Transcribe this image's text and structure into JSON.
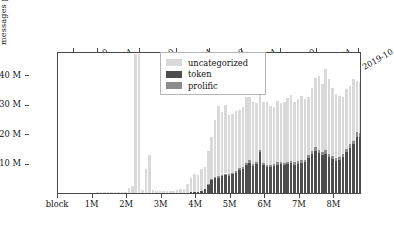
{
  "chart_data": {
    "type": "bar",
    "subtype": "stacked-bar",
    "title": "",
    "subtitle": "",
    "xlabel": "block",
    "ylabel": "messages per 100 k blocks",
    "xlim": [
      0,
      8800000
    ],
    "ylim": [
      0,
      48000000
    ],
    "grid": false,
    "legend_position": "top-center-inside",
    "bin_width_blocks": 100000,
    "y_tick_labels": [
      "10 M",
      "20 M",
      "30 M",
      "40 M"
    ],
    "y_tick_values": [
      10000000,
      20000000,
      30000000,
      40000000
    ],
    "x_bottom_tick_labels": [
      "block",
      "1M",
      "2M",
      "3M",
      "4M",
      "5M",
      "6M",
      "7M",
      "8M"
    ],
    "x_bottom_tick_values": [
      0,
      1000000,
      2000000,
      3000000,
      4000000,
      5000000,
      6000000,
      7000000,
      8000000
    ],
    "x_top_tick_labels": [
      "2015-10",
      "2016-04",
      "2016-10",
      "2017-04",
      "2017-10",
      "2018-04",
      "2018-10",
      "2019-04",
      "2019-10"
    ],
    "x_top_tick_values": [
      450000,
      1150000,
      2380000,
      3450000,
      4400000,
      5320000,
      6450000,
      7500000,
      8700000
    ],
    "series": [
      {
        "name": "uncategorized",
        "color": "#d9d9d9",
        "stack_order": 3
      },
      {
        "name": "token",
        "color": "#4d4d4d",
        "stack_order": 1
      },
      {
        "name": "prolific",
        "color": "#8c8c8c",
        "stack_order": 2
      }
    ],
    "x": [
      50000,
      150000,
      250000,
      350000,
      450000,
      550000,
      650000,
      750000,
      850000,
      950000,
      1050000,
      1150000,
      1250000,
      1350000,
      1450000,
      1550000,
      1650000,
      1750000,
      1850000,
      1950000,
      2050000,
      2150000,
      2250000,
      2350000,
      2450000,
      2550000,
      2650000,
      2750000,
      2850000,
      2950000,
      3050000,
      3150000,
      3250000,
      3350000,
      3450000,
      3550000,
      3650000,
      3750000,
      3850000,
      3950000,
      4050000,
      4150000,
      4250000,
      4350000,
      4450000,
      4550000,
      4650000,
      4750000,
      4850000,
      4950000,
      5050000,
      5150000,
      5250000,
      5350000,
      5450000,
      5550000,
      5650000,
      5750000,
      5850000,
      5950000,
      6050000,
      6150000,
      6250000,
      6350000,
      6450000,
      6550000,
      6650000,
      6750000,
      6850000,
      6950000,
      7050000,
      7150000,
      7250000,
      7350000,
      7450000,
      7550000,
      7650000,
      7750000,
      7850000,
      7950000,
      8050000,
      8150000,
      8250000,
      8350000,
      8450000,
      8550000,
      8650000,
      8750000
    ],
    "values_uncategorized": [
      30000,
      40000,
      50000,
      60000,
      70000,
      80000,
      90000,
      100000,
      110000,
      120000,
      150000,
      180000,
      200000,
      220000,
      250000,
      280000,
      300000,
      330000,
      360000,
      400000,
      1600000,
      2300000,
      47000000,
      47000000,
      1100000,
      8200000,
      12800000,
      900000,
      700000,
      600000,
      550000,
      600000,
      700000,
      800000,
      1000000,
      1200000,
      1500000,
      2900000,
      4900000,
      6100000,
      5600000,
      7600000,
      7500000,
      11200000,
      14400000,
      19400000,
      23800000,
      21500000,
      23000000,
      20200000,
      19800000,
      20100000,
      19600000,
      20300000,
      22200000,
      21300000,
      21100000,
      19900000,
      18900000,
      20700000,
      21000000,
      20000000,
      19400000,
      20600000,
      19800000,
      20400000,
      21700000,
      22100000,
      20400000,
      21100000,
      21600000,
      20500000,
      19600000,
      21400000,
      23500000,
      24800000,
      23200000,
      27600000,
      25400000,
      23100000,
      21900000,
      20600000,
      19200000,
      20300000,
      19700000,
      21000000,
      17300000,
      17200000
    ],
    "values_token": [
      0,
      0,
      0,
      0,
      0,
      0,
      0,
      0,
      0,
      0,
      0,
      0,
      0,
      0,
      0,
      0,
      0,
      0,
      0,
      0,
      0,
      0,
      0,
      0,
      0,
      0,
      0,
      0,
      0,
      0,
      0,
      0,
      0,
      0,
      0,
      0,
      0,
      100000,
      200000,
      300000,
      400000,
      600000,
      1400000,
      2900000,
      4500000,
      5100000,
      5200000,
      5600000,
      6100000,
      5800000,
      6300000,
      6900000,
      7800000,
      8200000,
      9400000,
      10200000,
      9100000,
      9800000,
      13800000,
      9400000,
      8900000,
      8700000,
      9000000,
      9600000,
      9800000,
      9400000,
      9700000,
      10100000,
      9600000,
      9900000,
      10200000,
      10400000,
      11800000,
      13100000,
      14200000,
      13600000,
      12800000,
      13300000,
      12100000,
      11500000,
      10800000,
      11200000,
      12200000,
      13700000,
      15300000,
      16400000,
      19000000,
      18900000
    ],
    "values_prolific": [
      0,
      0,
      0,
      0,
      0,
      0,
      0,
      0,
      0,
      0,
      0,
      0,
      0,
      0,
      0,
      0,
      0,
      0,
      0,
      0,
      0,
      0,
      0,
      0,
      0,
      0,
      0,
      0,
      0,
      0,
      0,
      0,
      0,
      0,
      0,
      0,
      0,
      0,
      0,
      0,
      0,
      0,
      0,
      100000,
      200000,
      300000,
      400000,
      400000,
      500000,
      500000,
      600000,
      600000,
      700000,
      700000,
      800000,
      800000,
      700000,
      700000,
      900000,
      700000,
      700000,
      700000,
      700000,
      800000,
      800000,
      800000,
      800000,
      800000,
      800000,
      800000,
      900000,
      900000,
      1000000,
      1100000,
      1200000,
      1100000,
      1000000,
      1100000,
      1000000,
      900000,
      900000,
      900000,
      1000000,
      1100000,
      1200000,
      1300000,
      1500000,
      1400000
    ],
    "annotations": [
      {
        "text": "two off-scale spikes near block 2.3M–2.4M clipped at axis top",
        "block": 2350000
      }
    ]
  },
  "legend": {
    "items": [
      {
        "label": "uncategorized",
        "color": "#d9d9d9"
      },
      {
        "label": "token",
        "color": "#4d4d4d"
      },
      {
        "label": "prolific",
        "color": "#8c8c8c"
      }
    ]
  },
  "axes": {
    "y_label": "messages per 100 k blocks",
    "y_ticks": [
      "10 M",
      "20 M",
      "30 M",
      "40 M"
    ],
    "x_bottom_ticks": [
      "block",
      "1M",
      "2M",
      "3M",
      "4M",
      "5M",
      "6M",
      "7M",
      "8M"
    ],
    "x_top_ticks": [
      "2015-10",
      "2016-04",
      "2016-10",
      "2017-04",
      "2017-10",
      "2018-04",
      "2018-10",
      "2019-04",
      "2019-10"
    ]
  }
}
